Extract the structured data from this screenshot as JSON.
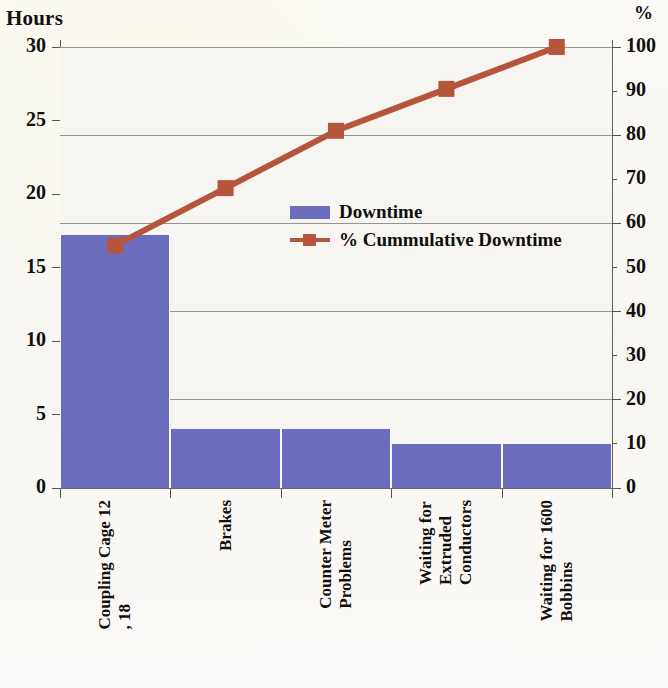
{
  "chart_data": {
    "type": "bar",
    "title": "",
    "subtitle": "",
    "xlabel": "",
    "ylabel": "Hours",
    "y2label": "%",
    "ylim": [
      0,
      30
    ],
    "y2lim": [
      0,
      100
    ],
    "grid": true,
    "legend_position": "inside-upper-right",
    "categories": [
      "Coupling Cage 12, 18",
      "Brakes",
      "Counter Meter Problems",
      "Waiting for Extruded Conductors",
      "Waiting for 1600 Bobbins"
    ],
    "category_lines": [
      [
        "Coupling Cage 12",
        ", 18"
      ],
      [
        "Brakes"
      ],
      [
        "Counter Meter",
        "Problems"
      ],
      [
        "Waiting for",
        "Extruded",
        "Conductors"
      ],
      [
        "Waiting for 1600",
        "Bobbins"
      ]
    ],
    "series": [
      {
        "name": "Downtime",
        "type": "bar",
        "axis": "left",
        "unit": "Hours",
        "color": "#6a6dbe",
        "values": [
          17.2,
          4,
          4,
          3,
          3
        ]
      },
      {
        "name": "% Cummulative Downtime",
        "type": "line",
        "axis": "right",
        "unit": "%",
        "color": "#b5553c",
        "values": [
          55,
          68,
          81,
          90.5,
          100
        ]
      }
    ],
    "y_ticks": [
      0,
      5,
      10,
      15,
      20,
      25,
      30
    ],
    "y2_ticks": [
      0,
      10,
      20,
      30,
      40,
      50,
      60,
      70,
      80,
      90,
      100
    ],
    "y_tick_labels": [
      "0",
      "5",
      "10",
      "15",
      "20",
      "25",
      "30"
    ],
    "y2_tick_labels": [
      "0",
      "10",
      "20",
      "30",
      "40",
      "50",
      "60",
      "70",
      "80",
      "90",
      "100"
    ]
  },
  "axes": {
    "left_title": "Hours",
    "right_title": "%"
  },
  "legend": {
    "items": [
      {
        "label": "Downtime",
        "marker": "bar-swatch",
        "color": "#6a6dbe"
      },
      {
        "label": "% Cummulative Downtime",
        "marker": "line-square-swatch",
        "color": "#b5553c"
      }
    ]
  },
  "colors": {
    "bar": "#6a6dbe",
    "line": "#b5553c",
    "grid": "#6f6f6f",
    "axis": "#555555",
    "plot_bg": "#f6f5f1",
    "page_bg": "#fbfaf8",
    "text": "#100f0d"
  }
}
